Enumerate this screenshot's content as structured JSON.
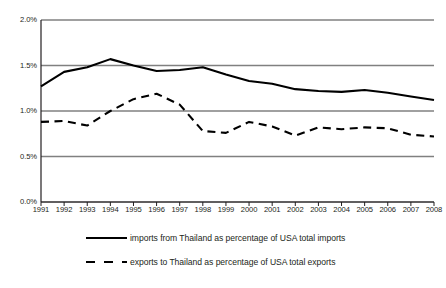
{
  "chart_data": {
    "type": "line",
    "title": "",
    "xlabel": "",
    "ylabel": "",
    "categories": [
      "1991",
      "1992",
      "1993",
      "1994",
      "1995",
      "1996",
      "1997",
      "1998",
      "1999",
      "2000",
      "2001",
      "2002",
      "2003",
      "2004",
      "2005",
      "2006",
      "2007",
      "2008"
    ],
    "ylim": [
      0,
      2.0
    ],
    "ytick_values": [
      0.0,
      0.5,
      1.0,
      1.5,
      2.0
    ],
    "ytick_labels": [
      "0.0%",
      "0.5%",
      "1.0%",
      "1.5%",
      "2.0%"
    ],
    "grid": true,
    "grid_axis": "y",
    "legend_position": "bottom",
    "value_unit": "percent",
    "series": [
      {
        "name": "imports from Thailand as percentage of USA total imports",
        "style": "solid",
        "color": "#000000",
        "values": [
          1.27,
          1.43,
          1.48,
          1.57,
          1.5,
          1.44,
          1.45,
          1.48,
          1.4,
          1.33,
          1.3,
          1.24,
          1.22,
          1.21,
          1.23,
          1.2,
          1.16,
          1.12
        ]
      },
      {
        "name": "exports to Thailand as percentage of USA total exports",
        "style": "dashed",
        "color": "#000000",
        "values": [
          0.88,
          0.89,
          0.84,
          1.0,
          1.13,
          1.19,
          1.07,
          0.78,
          0.76,
          0.88,
          0.83,
          0.73,
          0.82,
          0.8,
          0.82,
          0.81,
          0.74,
          0.72
        ]
      }
    ]
  },
  "axes": {
    "y_labels": [
      "2.0%",
      "1.5%",
      "1.0%",
      "0.5%",
      "0.0%"
    ],
    "x_labels": [
      "1991",
      "1992",
      "1993",
      "1994",
      "1995",
      "1996",
      "1997",
      "1998",
      "1999",
      "2000",
      "2001",
      "2002",
      "2003",
      "2004",
      "2005",
      "2006",
      "2007",
      "2008"
    ]
  },
  "legend": {
    "items": [
      {
        "label": "imports from Thailand as percentage of USA total imports",
        "style": "solid"
      },
      {
        "label": "exports to Thailand as percentage of USA total exports",
        "style": "dashed"
      }
    ]
  },
  "colors": {
    "line": "#000000",
    "grid": "#808080",
    "axis": "#231f20",
    "background": "#ffffff"
  }
}
